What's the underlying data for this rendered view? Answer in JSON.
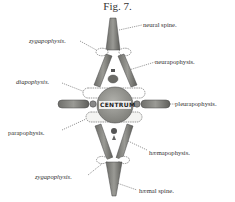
{
  "figure": {
    "title": "Fig. 7.",
    "centrum_label": "CENTRUM",
    "labels": {
      "neural_spine": "neural spine.",
      "zygapophysis_upper": "zygapophysis.",
      "neurapophysis": "neurapophysis.",
      "diapophysis": "diapophysis.",
      "pleurapophysis": "pleurapophysis.",
      "parapophysis": "parapophysis.",
      "haemapophysis": "hæmapophysis.",
      "zygapophysis_lower": "zygapophysis.",
      "haemal_spine": "hæmal spine."
    },
    "colors": {
      "bone_fill": "#8a8a86",
      "bone_dark": "#5a5a58",
      "centrum_fill": "#9a9a96",
      "outline": "#555555",
      "text": "#333333",
      "background": "#ffffff"
    }
  }
}
